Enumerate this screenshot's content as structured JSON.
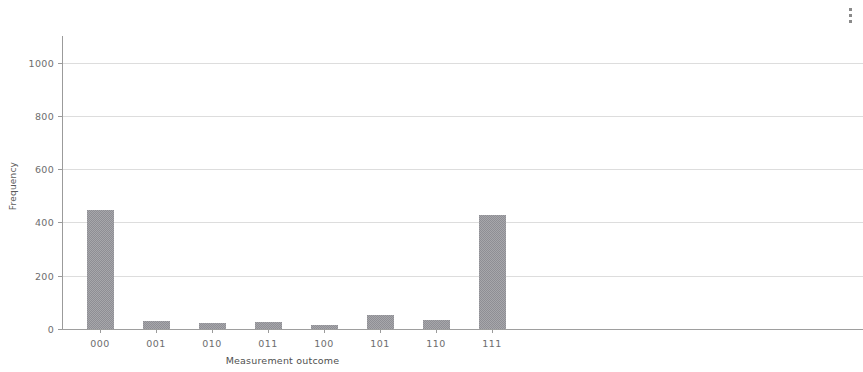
{
  "toolbar": {
    "menu_icon": "kebab-menu-icon",
    "menu_label": "⋮"
  },
  "chart_data": {
    "type": "bar",
    "title": "",
    "subtitle": "",
    "xlabel": "Measurement outcome",
    "ylabel": "Frequency",
    "categories": [
      "000",
      "001",
      "010",
      "011",
      "100",
      "101",
      "110",
      "111"
    ],
    "values": [
      447,
      30,
      21,
      25,
      14,
      51,
      32,
      428
    ],
    "ytick_labels": [
      "0",
      "200",
      "400",
      "600",
      "800",
      "1000"
    ],
    "yticks": [
      0,
      200,
      400,
      600,
      800,
      1000
    ],
    "ylim": [
      0,
      1100
    ],
    "grid": true,
    "grid_axis": "y",
    "legend": false,
    "bar_color": "#8e8e94",
    "axis_color": "#9b9b9b",
    "grid_color": "#dddddd",
    "background": "#ffffff"
  }
}
